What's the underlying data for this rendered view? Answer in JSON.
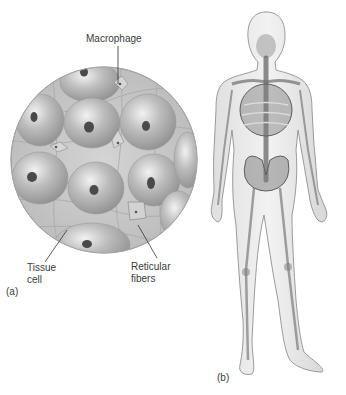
{
  "figure": {
    "panel_a": {
      "label": "(a)",
      "description": "Magnified circular view of tissue cells with macrophages and reticular fibers",
      "callouts": {
        "macrophage": "Macrophage",
        "tissue_cell_line1": "Tissue",
        "tissue_cell_line2": "cell",
        "reticular_line1": "Reticular",
        "reticular_line2": "fibers"
      }
    },
    "panel_b": {
      "label": "(b)",
      "description": "Translucent human figure showing skeleton and organs"
    },
    "colors": {
      "background": "#ffffff",
      "tissue_fill": "#c9c9c9",
      "cell_fill": "#b5b5b5",
      "nucleus": "#4a4a4a",
      "body_outline": "#9a9a9a",
      "skeleton": "#6e6e6e"
    }
  }
}
